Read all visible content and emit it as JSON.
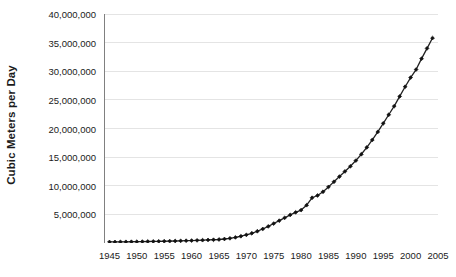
{
  "chart_data": {
    "type": "line",
    "title": "",
    "xlabel": "",
    "ylabel": "Cubic Meters per Day",
    "xlim": [
      1944,
      2005
    ],
    "ylim": [
      0,
      40000000
    ],
    "ytick_values": [
      0,
      5000000,
      10000000,
      15000000,
      20000000,
      25000000,
      30000000,
      35000000,
      40000000
    ],
    "ytick_labels": [
      "",
      "5,000,000",
      "10,000,000",
      "15,000,000",
      "20,000,000",
      "25,000,000",
      "30,000,000",
      "35,000,000",
      "40,000,000"
    ],
    "xtick_values": [
      1945,
      1950,
      1955,
      1960,
      1965,
      1970,
      1975,
      1980,
      1985,
      1990,
      1995,
      2000,
      2005
    ],
    "xtick_labels": [
      "1945",
      "1950",
      "1955",
      "1960",
      "1965",
      "1970",
      "1975",
      "1980",
      "1985",
      "1990",
      "1995",
      "2000",
      "2005"
    ],
    "minor_xticks": true,
    "grid": "horizontal",
    "legend": "none",
    "marker": "diamond",
    "line_color": "#222222",
    "marker_color": "#111111",
    "grid_color": "#e4e4e4",
    "axis_color": "#808080",
    "series": [
      {
        "name": "Cubic Meters per Day",
        "x": [
          1945,
          1946,
          1947,
          1948,
          1949,
          1950,
          1951,
          1952,
          1953,
          1954,
          1955,
          1956,
          1957,
          1958,
          1959,
          1960,
          1961,
          1962,
          1963,
          1964,
          1965,
          1966,
          1967,
          1968,
          1969,
          1970,
          1971,
          1972,
          1973,
          1974,
          1975,
          1976,
          1977,
          1978,
          1979,
          1980,
          1981,
          1982,
          1983,
          1984,
          1985,
          1986,
          1987,
          1988,
          1989,
          1990,
          1991,
          1992,
          1993,
          1994,
          1995,
          1996,
          1997,
          1998,
          1999,
          2000,
          2001,
          2002,
          2003,
          2004
        ],
        "values": [
          180000,
          190000,
          200000,
          210000,
          220000,
          230000,
          245000,
          260000,
          275000,
          290000,
          310000,
          330000,
          350000,
          375000,
          400000,
          430000,
          460000,
          495000,
          530000,
          570000,
          615000,
          700000,
          820000,
          980000,
          1180000,
          1420000,
          1700000,
          2050000,
          2450000,
          2900000,
          3400000,
          3900000,
          4400000,
          4900000,
          5350000,
          5750000,
          6600000,
          7900000,
          8300000,
          8950000,
          9800000,
          10700000,
          11600000,
          12500000,
          13400000,
          14400000,
          15500000,
          16700000,
          18000000,
          19400000,
          20900000,
          22400000,
          23900000,
          25600000,
          27300000,
          28900000,
          30300000,
          32200000,
          34000000,
          35800000
        ]
      }
    ]
  }
}
